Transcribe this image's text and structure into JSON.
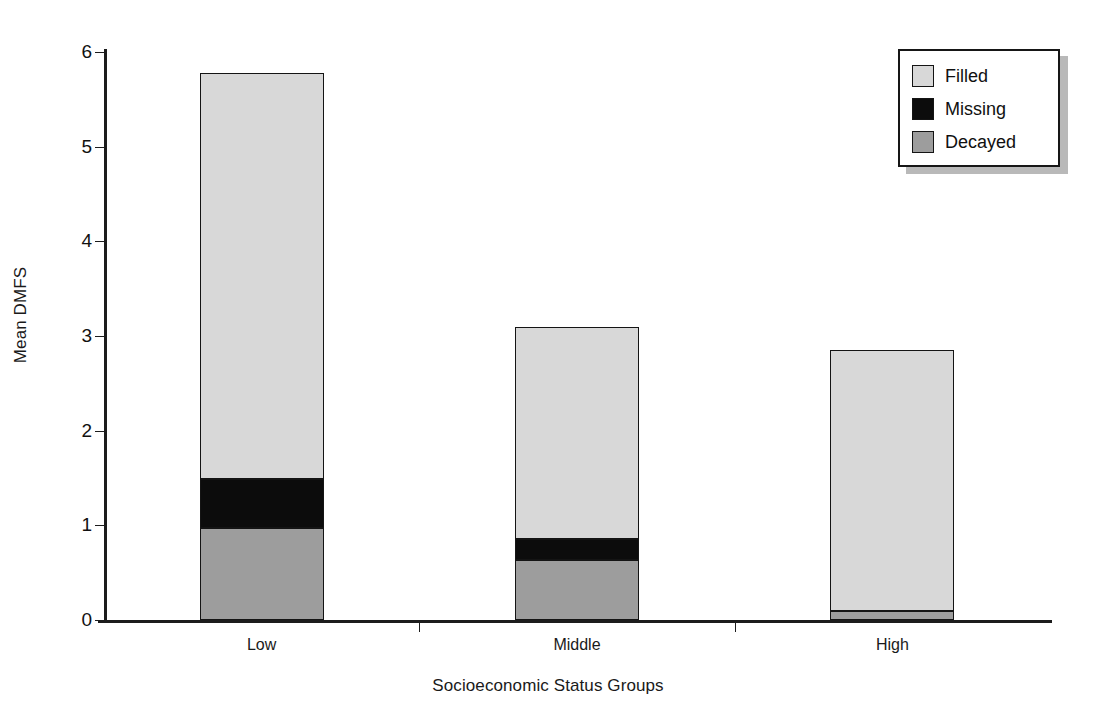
{
  "chart_data": {
    "type": "bar",
    "subtype": "stacked-vertical",
    "title": "",
    "xlabel": "Socioeconomic Status Groups",
    "ylabel": "Mean DMFS",
    "categories": [
      "Low",
      "Middle",
      "High"
    ],
    "series": [
      {
        "name": "Decayed",
        "color": "#9d9d9d",
        "values": [
          0.97,
          0.63,
          0.09
        ]
      },
      {
        "name": "Missing",
        "color": "#0c0c0c",
        "values": [
          0.52,
          0.23,
          0.0
        ]
      },
      {
        "name": "Filled",
        "color": "#d8d8d8",
        "values": [
          4.29,
          2.24,
          2.76
        ]
      }
    ],
    "stack_order_bottom_to_top": [
      "Decayed",
      "Missing",
      "Filled"
    ],
    "totals": [
      5.78,
      3.1,
      2.85
    ],
    "ylim": [
      0,
      6
    ],
    "yticks": [
      0,
      1,
      2,
      3,
      4,
      5,
      6
    ],
    "ytick_labels": [
      "0",
      "1",
      "2",
      "3",
      "4",
      "5",
      "6"
    ],
    "grid": "horizontal",
    "legend_position": "top-right",
    "legend_entries": [
      "Filled",
      "Missing",
      "Decayed"
    ]
  },
  "axes": {
    "y_title": "Mean DMFS",
    "x_title": "Socioeconomic Status Groups",
    "y_tick_labels": [
      "6",
      "5",
      "4",
      "3",
      "2",
      "1",
      "0"
    ],
    "x_tick_labels": [
      "Low",
      "Middle",
      "High"
    ]
  },
  "legend": {
    "items": [
      {
        "label": "Filled",
        "swatch_color": "#d8d8d8"
      },
      {
        "label": "Missing",
        "swatch_color": "#0c0c0c"
      },
      {
        "label": "Decayed",
        "swatch_color": "#9d9d9d"
      }
    ]
  }
}
